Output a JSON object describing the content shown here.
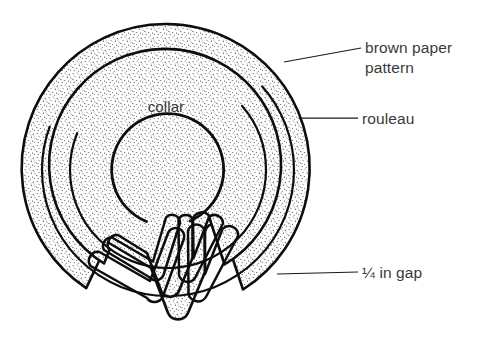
{
  "figure": {
    "background_color": "#ffffff",
    "ink_color": "#0d0d0d",
    "stipple_color": "#4a4a4a",
    "label_color": "#3a3a3a"
  },
  "labels": {
    "collar": "collar",
    "brown_paper_pattern_line1": "brown paper",
    "brown_paper_pattern_line2": "pattern",
    "rouleau": "rouleau",
    "gap": "¼ in gap"
  },
  "parts": [
    {
      "name": "brown paper pattern",
      "description": "outer stippled band"
    },
    {
      "name": "rouleau",
      "description": "inner stippled band"
    },
    {
      "name": "collar",
      "description": "inner open circle"
    },
    {
      "name": "¼ in gap",
      "description": "opening between folded tail ends"
    }
  ]
}
